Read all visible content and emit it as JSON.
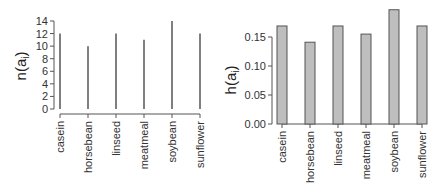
{
  "chart_data": [
    {
      "type": "bar",
      "style": "spike",
      "title": "",
      "xlabel": "",
      "ylabel": "n(a_i)",
      "ylabel_main": "n(a",
      "ylabel_sub": "i",
      "ylabel_close": ")",
      "categories": [
        "casein",
        "horsebean",
        "linseed",
        "meatmeal",
        "soybean",
        "sunflower"
      ],
      "values": [
        12,
        10,
        12,
        11,
        14,
        12
      ],
      "ylim": [
        0,
        14
      ],
      "yticks": [
        0,
        2,
        4,
        6,
        8,
        10,
        12,
        14
      ],
      "ytick_labels": [
        "0",
        "2",
        "4",
        "6",
        "8",
        "10",
        "12",
        "14"
      ],
      "grid": false,
      "color": "#555555"
    },
    {
      "type": "bar",
      "title": "",
      "xlabel": "",
      "ylabel": "h(a_i)",
      "ylabel_main": "h(a",
      "ylabel_sub": "i",
      "ylabel_close": ")",
      "categories": [
        "casein",
        "horsebean",
        "linseed",
        "meatmeal",
        "soybean",
        "sunflower"
      ],
      "values": [
        0.169,
        0.141,
        0.169,
        0.155,
        0.197,
        0.169
      ],
      "ylim": [
        0,
        0.2
      ],
      "yticks": [
        0.0,
        0.05,
        0.1,
        0.15
      ],
      "ytick_labels": [
        "0.00",
        "0.05",
        "0.10",
        "0.15"
      ],
      "grid": false,
      "color": "#bebebe",
      "edge_color": "#555555"
    }
  ]
}
